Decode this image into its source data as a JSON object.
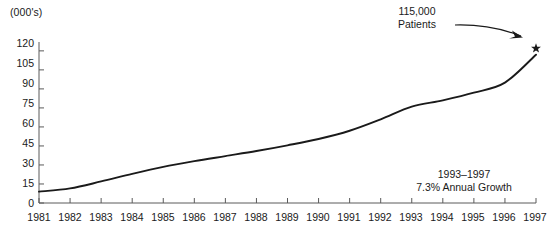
{
  "chart_data": {
    "type": "line",
    "title": "",
    "subtitle": "",
    "xlabel": "",
    "ylabel": "(000's)",
    "unit_label": "(000's)",
    "xlim": [
      1981,
      1997
    ],
    "ylim": [
      0,
      127
    ],
    "grid": false,
    "legend": "none",
    "x": [
      1981,
      1982,
      1983,
      1984,
      1985,
      1986,
      1987,
      1988,
      1989,
      1990,
      1991,
      1992,
      1993,
      1994,
      1995,
      1996,
      1997
    ],
    "categories": [
      "1981",
      "1982",
      "1983",
      "1984",
      "1985",
      "1986",
      "1987",
      "1988",
      "1989",
      "1990",
      "1991",
      "1992",
      "1993",
      "1994",
      "1995",
      "1996",
      "1997"
    ],
    "values": [
      9,
      11.5,
      17,
      23,
      28.5,
      33,
      37,
      41,
      45.5,
      50.5,
      57,
      66,
      76,
      81,
      87,
      95,
      117
    ],
    "series": [
      {
        "name": "Patients",
        "values": [
          9,
          11.5,
          17,
          23,
          28.5,
          33,
          37,
          41,
          45.5,
          50.5,
          57,
          66,
          76,
          81,
          87,
          95,
          117
        ]
      }
    ],
    "xticks": [
      "1981",
      "1982",
      "1983",
      "1984",
      "1985",
      "1986",
      "1987",
      "1988",
      "1989",
      "1990",
      "1991",
      "1992",
      "1993",
      "1994",
      "1995",
      "1996",
      "1997"
    ],
    "yticks": [
      "0",
      "15",
      "30",
      "45",
      "60",
      "75",
      "90",
      "105",
      "120"
    ],
    "ytick_values": [
      0,
      15,
      30,
      45,
      60,
      75,
      90,
      105,
      120
    ],
    "annotations": [
      {
        "name": "endpoint-callout",
        "lines": [
          "115,000",
          "Patients"
        ],
        "line1": "115,000",
        "line2": "Patients",
        "target_x": 1997,
        "target_y": 122,
        "marker": "star"
      },
      {
        "name": "growth-note",
        "lines": [
          "1993–1997",
          "7.3% Annual Growth"
        ],
        "line1": "1993–1997",
        "line2": "7.3% Annual Growth"
      }
    ],
    "colors": {
      "line": "#1a1a1a",
      "axis": "#4d4d4d",
      "text": "#1a1a1a",
      "background": "#ffffff"
    }
  }
}
